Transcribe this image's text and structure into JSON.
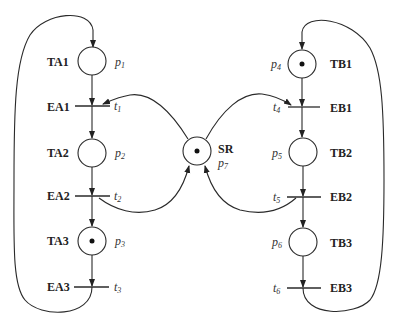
{
  "diagram": {
    "type": "petri-net",
    "places": [
      {
        "id": "p1",
        "name": "p",
        "sub": "1",
        "label": "TA1",
        "token": false
      },
      {
        "id": "p2",
        "name": "p",
        "sub": "2",
        "label": "TA2",
        "token": false
      },
      {
        "id": "p3",
        "name": "p",
        "sub": "3",
        "label": "TA3",
        "token": true
      },
      {
        "id": "p4",
        "name": "p",
        "sub": "4",
        "label": "TB1",
        "token": true
      },
      {
        "id": "p5",
        "name": "p",
        "sub": "5",
        "label": "TB2",
        "token": false
      },
      {
        "id": "p6",
        "name": "p",
        "sub": "6",
        "label": "TB3",
        "token": false
      },
      {
        "id": "p7",
        "name": "p",
        "sub": "7",
        "label": "SR",
        "token": true
      }
    ],
    "transitions": [
      {
        "id": "t1",
        "name": "t",
        "sub": "1",
        "label": "EA1"
      },
      {
        "id": "t2",
        "name": "t",
        "sub": "2",
        "label": "EA2"
      },
      {
        "id": "t3",
        "name": "t",
        "sub": "3",
        "label": "EA3"
      },
      {
        "id": "t4",
        "name": "t",
        "sub": "4",
        "label": "EB1"
      },
      {
        "id": "t5",
        "name": "t",
        "sub": "5",
        "label": "EB2"
      },
      {
        "id": "t6",
        "name": "t",
        "sub": "6",
        "label": "EB3"
      }
    ],
    "arcs": [
      "t3->p1",
      "p1->t1",
      "t1->p2",
      "p2->t2",
      "t2->p3",
      "p3->t3",
      "t6->p4",
      "p4->t4",
      "t4->p5",
      "p5->t5",
      "t5->p6",
      "p6->t6",
      "p7->t1",
      "p7->t4",
      "t2->p7",
      "t5->p7"
    ]
  }
}
